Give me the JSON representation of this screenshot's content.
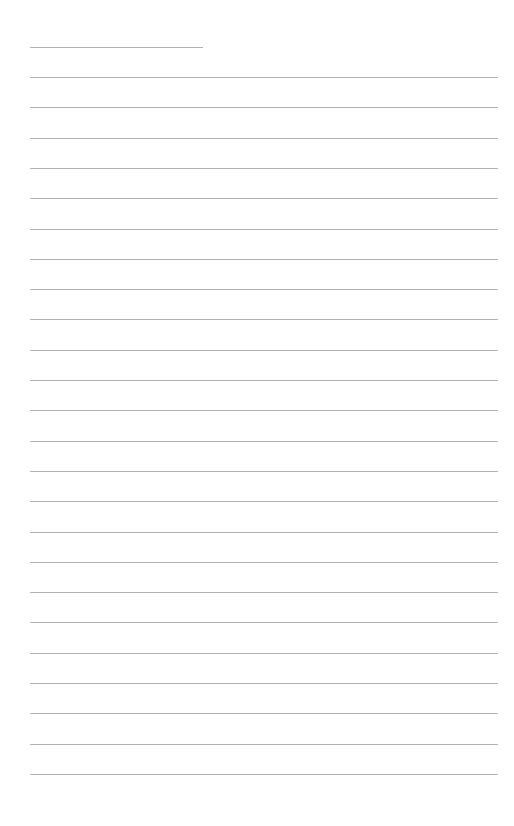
{
  "document": {
    "type": "lined-page",
    "background": "#ffffff",
    "line_color": "#9a9a9a",
    "header_line": {
      "x_start": 30,
      "x_end": 203,
      "y": 47
    },
    "ruled_lines": {
      "x_start": 30,
      "x_end": 498,
      "first_y": 77,
      "spacing": 30.3,
      "count": 24
    },
    "text": ""
  }
}
